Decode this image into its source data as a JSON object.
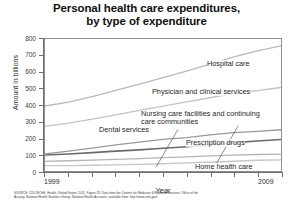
{
  "chart_data": {
    "type": "line",
    "title": "Personal health care expenditures, by type of expenditure",
    "title_line1": "Personal health care expenditures,",
    "title_line2": "by type of expenditure",
    "xlabel": "Year",
    "ylabel": "Amount in billions",
    "xlim": [
      1999,
      2009
    ],
    "ylim": [
      0,
      800
    ],
    "y_ticks": [
      0,
      100,
      200,
      300,
      400,
      500,
      600,
      700,
      800
    ],
    "y_tick_labels": [
      "0",
      "100",
      "200",
      "300",
      "400",
      "500",
      "600",
      "700",
      "800"
    ],
    "x_ticks": [
      1999,
      2000,
      2001,
      2002,
      2003,
      2004,
      2005,
      2006,
      2007,
      2008,
      2009
    ],
    "x_tick_labels_shown": [
      "1999",
      "2009"
    ],
    "x_label_start": "1999",
    "x_label_end": "2009",
    "grid": false,
    "legend_position": "inline-labels",
    "x": [
      1999,
      2000,
      2001,
      2002,
      2003,
      2004,
      2005,
      2006,
      2007,
      2008,
      2009
    ],
    "series": [
      {
        "name": "Hospital care",
        "color": "#b9b9b9",
        "values": [
          394,
          417,
          451,
          489,
          526,
          566,
          606,
          648,
          692,
          728,
          759
        ]
      },
      {
        "name": "Physician and clinical services",
        "color": "#c2c2c2",
        "values": [
          271,
          290,
          314,
          340,
          367,
          393,
          419,
          444,
          470,
          487,
          506
        ]
      },
      {
        "name": "Nursing care facilities and continuing care communities",
        "color": "#6b6b6b",
        "values": [
          97,
          103,
          111,
          120,
          128,
          138,
          147,
          157,
          172,
          182,
          191
        ]
      },
      {
        "name": "Prescription drugs",
        "color": "#9a9a9a",
        "values": [
          104,
          121,
          139,
          158,
          175,
          192,
          202,
          219,
          232,
          240,
          250
        ]
      },
      {
        "name": "Dental services",
        "color": "#b5b5b5",
        "values": [
          58,
          62,
          66,
          71,
          75,
          81,
          86,
          92,
          96,
          100,
          102
        ]
      },
      {
        "name": "Home health care",
        "color": "#c7c7c7",
        "values": [
          32,
          33,
          35,
          37,
          40,
          44,
          49,
          53,
          59,
          65,
          68
        ]
      }
    ],
    "annotations": [
      {
        "text": "Hospital care",
        "series": "Hospital care"
      },
      {
        "text": "Physician and clinical services",
        "series": "Physician and clinical services"
      },
      {
        "text": "Nursing care facilities and continuing care communities",
        "line1": "Nursing care facilities and continuing",
        "line2": "care communities",
        "series": "Nursing care facilities and continuing care communities"
      },
      {
        "text": "Prescription drugs",
        "series": "Prescription drugs"
      },
      {
        "text": "Dental services",
        "series": "Dental services"
      },
      {
        "text": "Home health care",
        "series": "Home health care"
      }
    ]
  },
  "source": {
    "line1": "SOURCE: CDC/NCHS, Health, United States, 2011. Figure 29. Data from the Centers for Medicare & Medicaid Services, Office of the",
    "line2": "Actuary, National Health Statistics Group, National Health Accounts, available from: http://www.cms.gov/."
  }
}
